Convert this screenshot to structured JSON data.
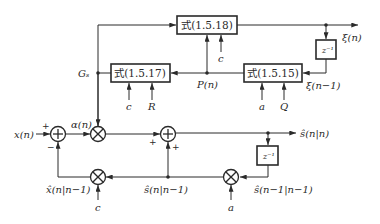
{
  "diagram": {
    "title": "",
    "blocks": {
      "eq_1518": "式(1.5.18)",
      "eq_1517": "式(1.5.17)",
      "eq_1515": "式(1.5.15)",
      "delay_top": "z⁻¹",
      "delay_bottom": "z⁻¹"
    },
    "signals": {
      "input": "x(n)",
      "innovation": "α(n)",
      "gain": "Gₛ",
      "covariance": "P(n)",
      "xi_out": "ξ(n)",
      "xi_prev": "ξ(n−1)",
      "estimate_out": "ŝ(n|n)",
      "estimate_prev": "ŝ(n−1|n−1)",
      "prediction": "ŝ(n|n−1)",
      "obs_prediction": "x̂(n|n−1)"
    },
    "parameters": {
      "c_top": "c",
      "c_mid": "c",
      "R": "R",
      "a_mid": "a",
      "Q": "Q",
      "c_bottom": "c",
      "a_bottom": "a"
    },
    "signs": {
      "sum1_plus": "+",
      "sum1_minus": "−",
      "sum2_plus_left": "+",
      "sum2_plus_bottom": "+"
    },
    "operators": {
      "sum": "+",
      "multiply": "×"
    }
  }
}
